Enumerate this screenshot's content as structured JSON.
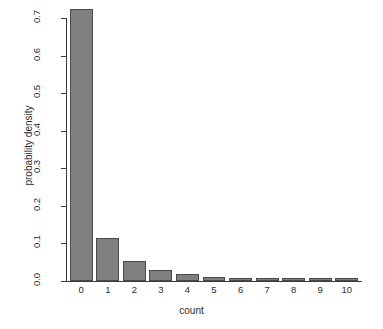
{
  "chart_data": {
    "type": "bar",
    "title": "",
    "subtitle": "",
    "xlabel": "count",
    "ylabel": "probability density",
    "categories": [
      "0",
      "1",
      "2",
      "3",
      "4",
      "5",
      "6",
      "7",
      "8",
      "9",
      "10"
    ],
    "values": [
      0.725,
      0.114,
      0.053,
      0.029,
      0.018,
      0.011,
      0.007,
      0.005,
      0.004,
      0.003,
      0.002
    ],
    "series": [
      {
        "name": "probability density",
        "values": [
          0.725,
          0.114,
          0.053,
          0.029,
          0.018,
          0.011,
          0.007,
          0.005,
          0.004,
          0.003,
          0.002
        ]
      }
    ],
    "ylim": [
      0.0,
      0.725
    ],
    "xlim": [
      0,
      11
    ],
    "y_ticks": [
      0.0,
      0.1,
      0.2,
      0.3,
      0.4,
      0.5,
      0.6,
      0.7
    ],
    "y_tick_labels": [
      "0.0",
      "0.1",
      "0.2",
      "0.3",
      "0.4",
      "0.5",
      "0.6",
      "0.7"
    ],
    "x_tick_labels": [
      "0",
      "1",
      "2",
      "3",
      "4",
      "5",
      "6",
      "7",
      "8",
      "9",
      "10"
    ],
    "grid": false,
    "legend": null,
    "legend_position": "none",
    "annotations": [],
    "colors": {
      "bar_fill": "#808080",
      "bar_border": "#4b4b4b",
      "axis": "#3a3a3a",
      "text": "#2b2b2b",
      "background": "#ffffff"
    }
  }
}
